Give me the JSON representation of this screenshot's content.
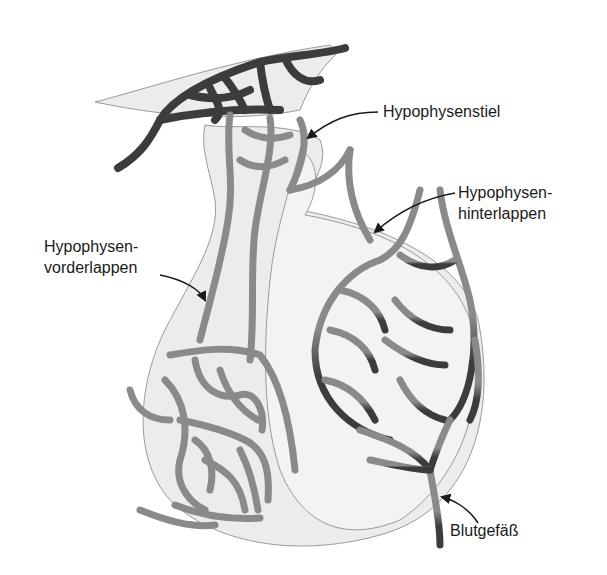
{
  "diagram": {
    "labels": {
      "stalk": "Hypophysenstiel",
      "posterior_line1": "Hypophysen-",
      "posterior_line2": "hinterlappen",
      "anterior_line1": "Hypophysen-",
      "anterior_line2": "vorderlappen",
      "vessel": "Blutgefäß"
    },
    "colors": {
      "tissue_fill": "#ececec",
      "tissue_stroke": "#9a9a9a",
      "vessel_dark": "#3c3c3c",
      "vessel_light": "#8a8a8a",
      "text": "#1a1a1a",
      "background": "#ffffff"
    }
  }
}
